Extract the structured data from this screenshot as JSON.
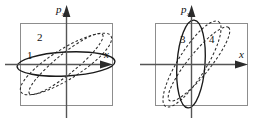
{
  "figure": {
    "background_color": "#ffffff",
    "frame_color": "#8d8d8d",
    "axis_color": "#555555",
    "solid_curve_color": "#1a1a1a",
    "dashed_curve_color": "#2a2a2a"
  },
  "panels": [
    {
      "id": "left-panel",
      "name": "left-phase-plot",
      "axes": {
        "x_label": "x",
        "y_label": "p",
        "y_label_subscript": "x"
      },
      "curve_labels": [
        {
          "text": "1",
          "x": 30,
          "y": 57
        },
        {
          "text": "2",
          "x": 40,
          "y": 38
        }
      ],
      "curves": [
        {
          "name": "solid-flat-ellipse",
          "style": "solid",
          "label": ""
        },
        {
          "name": "dashed-tilted-ellipse-1",
          "style": "dashed",
          "label": "1"
        },
        {
          "name": "dashed-tilted-ellipse-2",
          "style": "dashed",
          "label": "2"
        }
      ]
    },
    {
      "id": "right-panel",
      "name": "right-phase-plot",
      "axes": {
        "x_label": "x",
        "y_label": "p",
        "y_label_subscript": "x"
      },
      "curve_labels": [
        {
          "text": "3",
          "x": 182,
          "y": 40
        },
        {
          "text": "4",
          "x": 211,
          "y": 40
        }
      ],
      "curves": [
        {
          "name": "solid-tall-ellipse",
          "style": "solid",
          "label": "3"
        },
        {
          "name": "dashed-tilted-ellipse-3",
          "style": "dashed",
          "label": ""
        },
        {
          "name": "dashed-tilted-ellipse-4",
          "style": "dashed",
          "label": "4"
        }
      ]
    }
  ]
}
